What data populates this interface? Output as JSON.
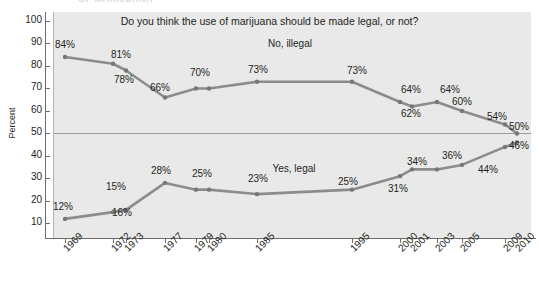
{
  "page": {
    "clipped_header_text": "OF MARIJUANA"
  },
  "chart_data": {
    "type": "line",
    "title": "Do you think the use of marijuana should be made legal, or not?",
    "xlabel": "",
    "ylabel": "Percent",
    "ylim": [
      0,
      100
    ],
    "yticks": [
      10,
      20,
      30,
      40,
      50,
      60,
      70,
      80,
      90,
      100
    ],
    "ytick_labels": [
      "10",
      "20",
      "30",
      "40",
      "50",
      "60",
      "70",
      "80",
      "90",
      "100"
    ],
    "grid": false,
    "legend_position": "inline-labels",
    "reference_line": 50,
    "categories": [
      "1969",
      "1972",
      "1973",
      "1977",
      "1979",
      "1980",
      "1985",
      "1995",
      "2000",
      "2001",
      "2003",
      "2005",
      "2009",
      "2010"
    ],
    "x": [
      1969,
      1972,
      1973,
      1977,
      1979,
      1980,
      1985,
      1995,
      2000,
      2001,
      2003,
      2005,
      2009,
      2010
    ],
    "series": [
      {
        "name": "No, illegal",
        "color": "#8c8c8c",
        "values": [
          84,
          81,
          78,
          66,
          70,
          70,
          73,
          73,
          64,
          62,
          64,
          60,
          54,
          50
        ],
        "data_labels": [
          "84%",
          "81%",
          "78%",
          "66%",
          "70%",
          "",
          "73%",
          "73%",
          "64%",
          "62%",
          "64%",
          "60%",
          "54%",
          "50%"
        ]
      },
      {
        "name": "Yes, legal",
        "color": "#8c8c8c",
        "values": [
          12,
          15,
          16,
          28,
          25,
          25,
          23,
          25,
          31,
          34,
          34,
          36,
          44,
          46
        ],
        "data_labels": [
          "12%",
          "15%",
          "16%",
          "28%",
          "25%",
          "",
          "23%",
          "25%",
          "31%",
          "34%",
          "36%",
          "",
          "44%",
          "46%"
        ]
      }
    ],
    "colors": {
      "plot_background": "#e9e9e9",
      "line": "#8c8c8c",
      "marker": "#777777",
      "axis": "#6e6e6e",
      "reference_line": "#9a9a9a",
      "text": "#231f20",
      "page_background": "#ffffff"
    }
  },
  "point_labels": {
    "no_illegal": [
      {
        "text": "84%",
        "x": 65,
        "y": 44
      },
      {
        "text": "81%",
        "x": 121,
        "y": 54
      },
      {
        "text": "78%",
        "x": 124,
        "y": 79
      },
      {
        "text": "66%",
        "x": 160,
        "y": 87
      },
      {
        "text": "70%",
        "x": 200,
        "y": 72
      },
      {
        "text": "73%",
        "x": 258,
        "y": 69
      },
      {
        "text": "73%",
        "x": 357,
        "y": 70
      },
      {
        "text": "64%",
        "x": 411,
        "y": 89
      },
      {
        "text": "62%",
        "x": 411,
        "y": 113
      },
      {
        "text": "64%",
        "x": 450,
        "y": 89
      },
      {
        "text": "60%",
        "x": 462,
        "y": 101
      },
      {
        "text": "54%",
        "x": 497,
        "y": 116
      },
      {
        "text": "50%",
        "x": 519,
        "y": 126
      }
    ],
    "yes_legal": [
      {
        "text": "12%",
        "x": 63,
        "y": 206
      },
      {
        "text": "15%",
        "x": 116,
        "y": 186
      },
      {
        "text": "16%",
        "x": 122,
        "y": 212
      },
      {
        "text": "28%",
        "x": 161,
        "y": 170
      },
      {
        "text": "25%",
        "x": 202,
        "y": 173
      },
      {
        "text": "23%",
        "x": 258,
        "y": 178
      },
      {
        "text": "25%",
        "x": 348,
        "y": 181
      },
      {
        "text": "31%",
        "x": 398,
        "y": 188
      },
      {
        "text": "34%",
        "x": 417,
        "y": 161
      },
      {
        "text": "36%",
        "x": 452,
        "y": 155
      },
      {
        "text": "44%",
        "x": 488,
        "y": 169
      },
      {
        "text": "46%",
        "x": 519,
        "y": 145
      }
    ]
  },
  "series_names": [
    {
      "label": "No, illegal",
      "x": 290,
      "y": 43
    },
    {
      "label": "Yes, legal",
      "x": 294,
      "y": 168
    }
  ]
}
